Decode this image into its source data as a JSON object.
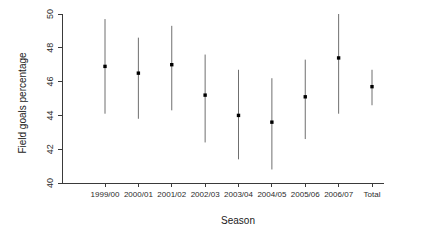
{
  "chart_data": {
    "type": "scatter",
    "title": "",
    "xlabel": "Season",
    "ylabel": "Field goals percentage",
    "categories": [
      "1999/00",
      "2000/01",
      "2001/02",
      "2002/03",
      "2003/04",
      "2004/05",
      "2005/06",
      "2006/07",
      "Total"
    ],
    "values": [
      46.9,
      46.5,
      47.0,
      45.2,
      44.0,
      43.6,
      45.1,
      47.4,
      45.7
    ],
    "lower": [
      44.1,
      43.8,
      44.3,
      42.4,
      41.4,
      40.8,
      42.6,
      44.1,
      44.6
    ],
    "upper": [
      49.7,
      48.6,
      49.3,
      47.6,
      46.7,
      46.2,
      47.3,
      50.0,
      46.7
    ],
    "ylim": [
      40,
      50
    ],
    "yticks": [
      40,
      42,
      44,
      46,
      48,
      50
    ],
    "ytick_labels": [
      "40",
      "42",
      "44",
      "46",
      "48",
      "50"
    ],
    "grid": false,
    "legend": false,
    "error_style": "vertical-range-bars",
    "point_marker": "filled-square"
  }
}
